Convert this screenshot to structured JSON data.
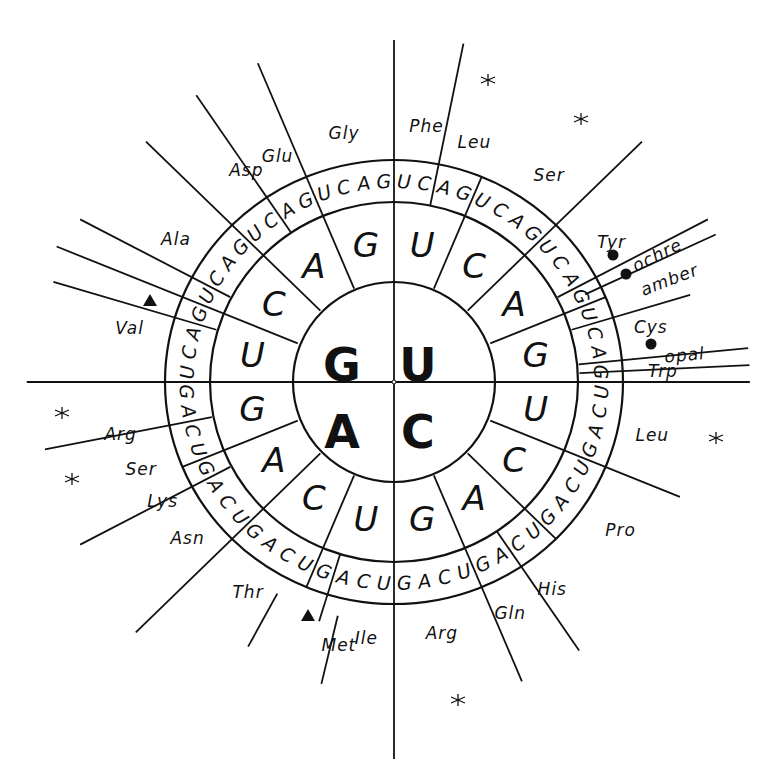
{
  "diagram": {
    "center": {
      "x": 394,
      "y": 382
    },
    "radii": {
      "inner": {
        "rx": 101,
        "ry": 100
      },
      "middle": {
        "rx": 184,
        "ry": 180
      },
      "outer": {
        "rx": 229,
        "ry": 222
      }
    },
    "first_base": [
      {
        "base": "U",
        "x": 418,
        "y": 365
      },
      {
        "base": "C",
        "x": 418,
        "y": 432
      },
      {
        "base": "A",
        "x": 342,
        "y": 432
      },
      {
        "base": "G",
        "x": 342,
        "y": 365
      }
    ],
    "base_order": [
      "U",
      "C",
      "A",
      "G"
    ],
    "amino_acids": [
      {
        "name": "Phe",
        "angle": 7,
        "r": 258
      },
      {
        "name": "Leu",
        "angle": 18,
        "r": 252
      },
      {
        "name": "Ser",
        "angle": 36,
        "r": 256
      },
      {
        "name": "Tyr",
        "angle": 56.5,
        "r": 253
      },
      {
        "name": "ochre",
        "angle": 63.5,
        "r": 285,
        "stop": true
      },
      {
        "name": "amber",
        "angle": 69,
        "r": 286,
        "stop": true
      },
      {
        "name": "Cys",
        "angle": 77.5,
        "r": 255
      },
      {
        "name": "opal",
        "angle": 84.5,
        "r": 283,
        "stop": true
      },
      {
        "name": "Trp",
        "angle": 87.6,
        "r": 261
      },
      {
        "name": "Leu",
        "angle": 102,
        "r": 256
      },
      {
        "name": "Pro",
        "angle": 124,
        "r": 265
      },
      {
        "name": "His",
        "angle": 143.5,
        "r": 258
      },
      {
        "name": "Gln",
        "angle": 154,
        "r": 257
      },
      {
        "name": "Arg",
        "angle": 169.5,
        "r": 255
      },
      {
        "name": "Ile",
        "angle": 186,
        "r": 257
      },
      {
        "name": "Met",
        "angle": 191.5,
        "r": 268,
        "start": true
      },
      {
        "name": "Thr",
        "angle": 214,
        "r": 253
      },
      {
        "name": "Asn",
        "angle": 232,
        "r": 254
      },
      {
        "name": "Lys",
        "angle": 242,
        "r": 254
      },
      {
        "name": "Ser",
        "angle": 250.5,
        "r": 260
      },
      {
        "name": "Arg",
        "angle": 259,
        "r": 270
      },
      {
        "name": "Val",
        "angle": 282,
        "r": 262
      },
      {
        "name": "Ala",
        "angle": 304,
        "r": 255
      },
      {
        "name": "Asp",
        "angle": 326,
        "r": 256
      },
      {
        "name": "Glu",
        "angle": 333.5,
        "r": 253
      },
      {
        "name": "Gly",
        "angle": 349,
        "r": 254
      }
    ],
    "spokes": [
      {
        "angle": 0,
        "r1": 0,
        "r2": 342
      },
      {
        "angle": 90,
        "r1": 0,
        "r2": 345
      },
      {
        "angle": 180,
        "r1": 0,
        "r2": 377
      },
      {
        "angle": 270,
        "r1": 0,
        "r2": 356
      },
      {
        "angle": 22.5,
        "r1": 101,
        "r2": 222
      },
      {
        "angle": 45,
        "r1": 101,
        "r2": 340
      },
      {
        "angle": 67.5,
        "r1": 101,
        "r2": 222
      },
      {
        "angle": 112.5,
        "r1": 101,
        "r2": 300
      },
      {
        "angle": 135,
        "r1": 101,
        "r2": 222
      },
      {
        "angle": 157.5,
        "r1": 101,
        "r2": 324
      },
      {
        "angle": 202.5,
        "r1": 101,
        "r2": 222
      },
      {
        "angle": 225,
        "r1": 101,
        "r2": 354
      },
      {
        "angle": 247.5,
        "r1": 101,
        "r2": 222
      },
      {
        "angle": 292.5,
        "r1": 101,
        "r2": 354
      },
      {
        "angle": 315,
        "r1": 101,
        "r2": 340
      },
      {
        "angle": 337.5,
        "r1": 101,
        "r2": 345
      },
      {
        "angle": 11.25,
        "r1": 180,
        "r2": 345
      },
      {
        "angle": 61.875,
        "r1": 180,
        "r2": 345
      },
      {
        "angle": 64.69,
        "r1": 205,
        "r2": 345
      },
      {
        "angle": 73.125,
        "r1": 180,
        "r2": 300
      },
      {
        "angle": 84.375,
        "r1": 180,
        "r2": 345
      },
      {
        "angle": 87.19,
        "r1": 180,
        "r2": 345
      },
      {
        "angle": 146.25,
        "r1": 180,
        "r2": 323
      },
      {
        "angle": 208.125,
        "r1": 240,
        "r2": 300
      },
      {
        "angle": 196.875,
        "r1": 180,
        "r2": 250
      },
      {
        "angle": 193.125,
        "r1": 240,
        "r2": 310
      },
      {
        "angle": 241.875,
        "r1": 180,
        "r2": 345
      },
      {
        "angle": 258.75,
        "r1": 180,
        "r2": 345
      },
      {
        "angle": 286.875,
        "r1": 180,
        "r2": 345
      },
      {
        "angle": 298.125,
        "r1": 180,
        "r2": 345
      },
      {
        "angle": 326.25,
        "r1": 180,
        "r2": 345
      }
    ],
    "stop_markers": [
      {
        "label": "ochre",
        "x": 613,
        "y": 255
      },
      {
        "label": "amber",
        "x": 626,
        "y": 274
      },
      {
        "label": "opal",
        "x": 651,
        "y": 344
      }
    ],
    "start_markers": [
      {
        "label": "Met",
        "x": 308,
        "y": 616
      },
      {
        "label": "Val-GUG",
        "x": 150,
        "y": 301
      }
    ],
    "stars": [
      {
        "x": 488,
        "y": 80
      },
      {
        "x": 581,
        "y": 119
      },
      {
        "x": 716,
        "y": 438
      },
      {
        "x": 62,
        "y": 413
      },
      {
        "x": 72,
        "y": 479
      },
      {
        "x": 458,
        "y": 700
      }
    ]
  }
}
